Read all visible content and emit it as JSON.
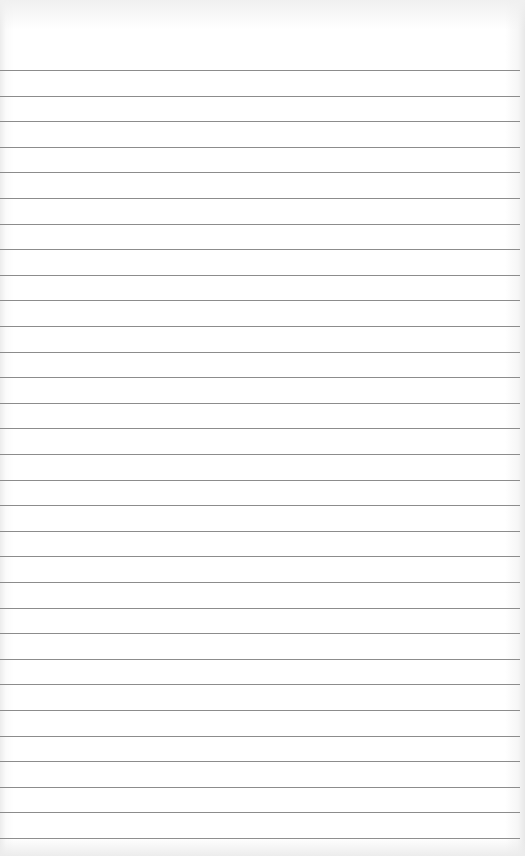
{
  "page": {
    "type": "blank lined paper",
    "line_count": 31,
    "first_line_y": 70,
    "line_spacing": 25.6,
    "line_color": "#8c8c8c",
    "paper_color": "#ffffff"
  }
}
